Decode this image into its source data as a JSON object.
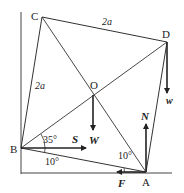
{
  "diagram": {
    "type": "physics-statics-figure",
    "points": {
      "A": "A",
      "B": "B",
      "C": "C",
      "D": "D",
      "O": "O"
    },
    "side_labels": {
      "CD": "2a",
      "BC": "2a"
    },
    "angles": {
      "at_B_upper": "35°",
      "at_B_lower": "10°",
      "at_A": "10°"
    },
    "forces": {
      "S": "S",
      "W": "W",
      "w": "w",
      "N": "N",
      "F": "F"
    },
    "colors": {
      "line": "#333333",
      "text": "#222222",
      "background": "#ffffff"
    }
  }
}
